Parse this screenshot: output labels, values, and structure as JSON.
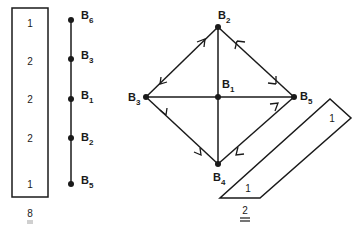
{
  "colors": {
    "ink": "#1a1a1a",
    "background": "#ffffff"
  },
  "left_panel": {
    "box_values": [
      "1",
      "2",
      "2",
      "2",
      "1"
    ],
    "chain_nodes": [
      {
        "base": "B",
        "sub": "6"
      },
      {
        "base": "B",
        "sub": "3"
      },
      {
        "base": "B",
        "sub": "1"
      },
      {
        "base": "B",
        "sub": "2"
      },
      {
        "base": "B",
        "sub": "5"
      }
    ],
    "caption": "8"
  },
  "right_panel": {
    "nodes": {
      "top": {
        "base": "B",
        "sub": "2"
      },
      "left": {
        "base": "B",
        "sub": "3"
      },
      "center": {
        "base": "B",
        "sub": "1"
      },
      "right": {
        "base": "B",
        "sub": "5"
      },
      "bottom": {
        "base": "B",
        "sub": "4"
      }
    },
    "parallelogram_values": [
      "1",
      "1"
    ],
    "caption": "2"
  }
}
